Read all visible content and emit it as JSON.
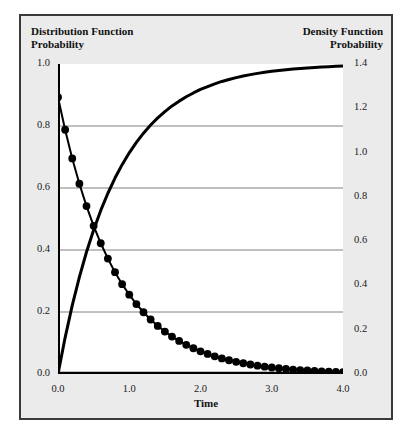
{
  "figure": {
    "left_axis_title": "Distribution Function\nProbability",
    "right_axis_title": "Density Function\nProbability",
    "x_axis_label": "Time"
  },
  "colors": {
    "panel_background": "#ebebeb",
    "plot_background": "#ffffff",
    "panel_border": "#3a3a3a",
    "curve": "#000000",
    "gridline": "#808080",
    "axis": "#000000",
    "text": "#111111"
  },
  "chart_data": {
    "type": "line",
    "title": "",
    "subtitle": "",
    "xlabel": "Time",
    "ylabel": "Distribution Function Probability",
    "y2label": "Density Function Probability",
    "xlim": [
      0.0,
      4.0
    ],
    "ylim": [
      0.0,
      1.0
    ],
    "y2lim": [
      0.0,
      1.4
    ],
    "xticks": [
      0.0,
      1.0,
      2.0,
      3.0,
      4.0
    ],
    "xtick_labels": [
      "0.0",
      "1.0",
      "2.0",
      "3.0",
      "4.0"
    ],
    "yticks": [
      0.0,
      0.2,
      0.4,
      0.6,
      0.8,
      1.0
    ],
    "ytick_labels": [
      "0.0",
      "0.2",
      "0.4",
      "0.6",
      "0.8",
      "1.0"
    ],
    "y2ticks": [
      0.0,
      0.2,
      0.4,
      0.6,
      0.8,
      1.0,
      1.2,
      1.4
    ],
    "y2tick_labels": [
      "0.0",
      "0.2",
      "0.4",
      "0.6",
      "0.8",
      "1.0",
      "1.2",
      "1.4"
    ],
    "grid": true,
    "grid_axis": "y",
    "gridlines_at": [
      0.2,
      0.4,
      0.6,
      0.8
    ],
    "legend": "none",
    "legend_position": "none",
    "rate_lambda": 1.25,
    "series": [
      {
        "name": "Distribution Function",
        "axis": "left",
        "marker": "none",
        "linewidth": 3,
        "x": [
          0.0,
          0.1,
          0.2,
          0.3,
          0.4,
          0.5,
          0.6,
          0.7,
          0.8,
          0.9,
          1.0,
          1.1,
          1.2,
          1.3,
          1.4,
          1.5,
          1.6,
          1.7,
          1.8,
          1.9,
          2.0,
          2.1,
          2.2,
          2.3,
          2.4,
          2.5,
          2.6,
          2.7,
          2.8,
          2.9,
          3.0,
          3.1,
          3.2,
          3.3,
          3.4,
          3.5,
          3.6,
          3.7,
          3.8,
          3.9,
          4.0
        ],
        "values": [
          0.0,
          0.1175,
          0.2212,
          0.3127,
          0.3935,
          0.4647,
          0.5276,
          0.5831,
          0.6321,
          0.6753,
          0.7135,
          0.7473,
          0.7769,
          0.8032,
          0.8262,
          0.8465,
          0.8647,
          0.8802,
          0.8943,
          0.9066,
          0.9179,
          0.9273,
          0.9361,
          0.9437,
          0.9502,
          0.9561,
          0.9612,
          0.9657,
          0.9698,
          0.9732,
          0.9765,
          0.9792,
          0.9817,
          0.9838,
          0.9857,
          0.9875,
          0.9889,
          0.9902,
          0.9914,
          0.9924,
          0.9933
        ]
      },
      {
        "name": "Density Function",
        "axis": "right",
        "marker": "circle",
        "marker_size": 5,
        "linewidth": 2,
        "x": [
          0.0,
          0.1,
          0.2,
          0.3,
          0.4,
          0.5,
          0.6,
          0.7,
          0.8,
          0.9,
          1.0,
          1.1,
          1.2,
          1.3,
          1.4,
          1.5,
          1.6,
          1.7,
          1.8,
          1.9,
          2.0,
          2.1,
          2.2,
          2.3,
          2.4,
          2.5,
          2.6,
          2.7,
          2.8,
          2.9,
          3.0,
          3.1,
          3.2,
          3.3,
          3.4,
          3.5,
          3.6,
          3.7,
          3.8,
          3.9,
          4.0
        ],
        "values": [
          1.25,
          1.1031,
          0.9735,
          0.8591,
          0.7582,
          0.6691,
          0.5904,
          0.5211,
          0.4598,
          0.4057,
          0.3581,
          0.316,
          0.2789,
          0.2461,
          0.2172,
          0.1917,
          0.1692,
          0.1493,
          0.1317,
          0.1162,
          0.1026,
          0.0905,
          0.0799,
          0.0705,
          0.0622,
          0.0549,
          0.0485,
          0.0428,
          0.0377,
          0.0333,
          0.0294,
          0.0259,
          0.0229,
          0.0202,
          0.0178,
          0.0157,
          0.0139,
          0.0123,
          0.0108,
          0.0095,
          0.0084
        ]
      }
    ]
  }
}
